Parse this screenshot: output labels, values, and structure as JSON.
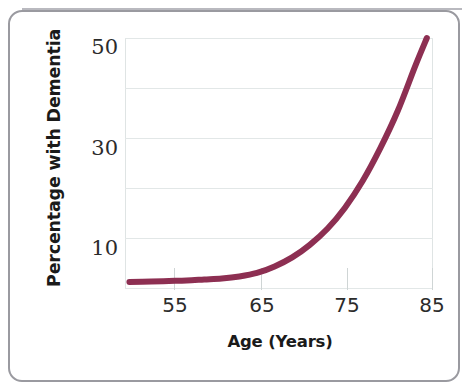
{
  "figure": {
    "background_color": "#ffffff",
    "frame_color": "#9a9aa0"
  },
  "axis": {
    "y_title": "Percentage with Dementia",
    "x_title": "Age (Years)",
    "y_tick_labels": [
      "50",
      "30",
      "10"
    ],
    "x_tick_labels": [
      "55",
      "65",
      "75",
      "85"
    ]
  },
  "chart_data": {
    "type": "line",
    "title": "",
    "subtitle": "",
    "xlabel": "Age (Years)",
    "ylabel": "Percentage with Dementia",
    "xlim": [
      50,
      85
    ],
    "ylim": [
      0,
      50
    ],
    "xticks": [
      55,
      65,
      75,
      85
    ],
    "yticks": [
      10,
      30,
      50
    ],
    "y_gridlines": [
      0,
      10,
      20,
      30,
      40,
      50
    ],
    "grid": true,
    "legend": null,
    "legend_position": "none",
    "line_color": "#8d2f52",
    "line_width_px": 6,
    "series": [
      {
        "name": "Percentage with Dementia",
        "x": [
          50.5,
          53,
          55,
          57,
          59,
          61,
          63,
          65,
          67,
          69,
          71,
          73,
          75,
          77,
          79,
          81,
          83,
          84.3
        ],
        "values": [
          1.4,
          1.5,
          1.6,
          1.7,
          1.9,
          2.1,
          2.5,
          3.2,
          4.5,
          6.3,
          8.8,
          12.0,
          16.2,
          21.5,
          28.0,
          35.5,
          44.5,
          50.0
        ]
      }
    ],
    "annotations": []
  }
}
